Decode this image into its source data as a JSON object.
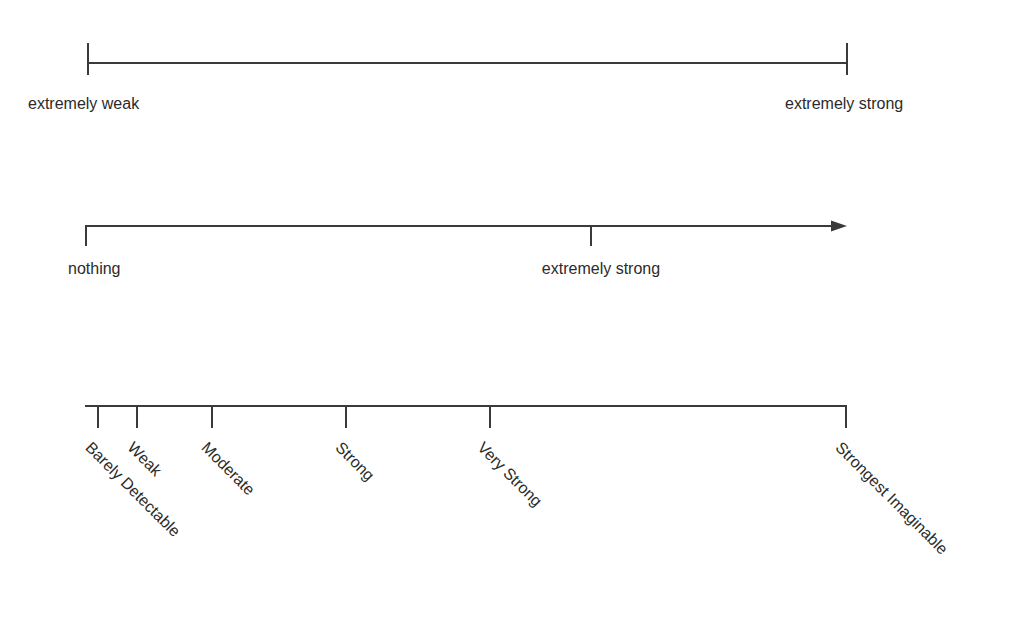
{
  "figure": {
    "background_color": "#ffffff",
    "line_color": "#3a3a3a",
    "text_color": "#2b2b2b"
  },
  "scales": [
    {
      "id": "scale-1",
      "kind": "bounded-line-scale",
      "axis": {
        "x_start": 88,
        "x_end": 847,
        "y": 63
      },
      "ticks": [
        {
          "label": "extremely weak",
          "x": 88,
          "direction": "both",
          "up": 20,
          "down": 12
        },
        {
          "label": "extremely strong",
          "x": 847,
          "direction": "both",
          "up": 20,
          "down": 12
        }
      ],
      "labels": [
        {
          "text": "extremely weak",
          "x": 28,
          "y": 95,
          "anchor": "left"
        },
        {
          "text": "extremely strong",
          "x": 785,
          "y": 95,
          "anchor": "left"
        }
      ]
    },
    {
      "id": "scale-2",
      "kind": "open-ended-arrow-scale",
      "axis": {
        "x_start": 85,
        "x_end": 847,
        "y": 226
      },
      "arrow": {
        "x_tip": 847,
        "y": 226,
        "head_length": 14,
        "head_width": 11
      },
      "ticks": [
        {
          "label": "nothing",
          "x": 86,
          "direction": "down",
          "down": 20
        },
        {
          "label": "extremely strong",
          "x": 591,
          "direction": "down",
          "down": 20
        }
      ],
      "labels": [
        {
          "text": "nothing",
          "x": 68,
          "y": 260,
          "anchor": "left"
        },
        {
          "text": "extremely strong",
          "x": 601,
          "y": 260,
          "anchor": "center"
        }
      ]
    },
    {
      "id": "scale-3",
      "kind": "labeled-magnitude-scale",
      "axis": {
        "x_start": 85,
        "x_end": 847,
        "y": 406
      },
      "ticks": [
        {
          "label": "Barely Detectable",
          "x": 98,
          "direction": "down",
          "down": 22
        },
        {
          "label": "Weak",
          "x": 137,
          "direction": "down",
          "down": 22
        },
        {
          "label": "Moderate",
          "x": 212,
          "direction": "down",
          "down": 22
        },
        {
          "label": "Strong",
          "x": 346,
          "direction": "down",
          "down": 22
        },
        {
          "label": "Very Strong",
          "x": 490,
          "direction": "down",
          "down": 22
        },
        {
          "label": "Strongest Imaginable",
          "x": 846,
          "direction": "down",
          "down": 22
        }
      ],
      "labels": [
        {
          "text": "Barely Detectable",
          "x": 88,
          "y": 437,
          "rotation": 45
        },
        {
          "text": "Weak",
          "x": 130,
          "y": 437,
          "rotation": 45
        },
        {
          "text": "Moderate",
          "x": 204,
          "y": 437,
          "rotation": 45
        },
        {
          "text": "Strong",
          "x": 338,
          "y": 437,
          "rotation": 45
        },
        {
          "text": "Very Strong",
          "x": 480,
          "y": 437,
          "rotation": 45
        },
        {
          "text": "Strongest Imaginable",
          "x": 838,
          "y": 437,
          "rotation": 45
        }
      ]
    }
  ]
}
